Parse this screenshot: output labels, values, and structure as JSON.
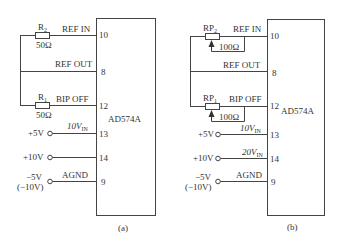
{
  "figure": {
    "panels": [
      {
        "id": "a",
        "caption": "(a)",
        "chip_label": "AD574A",
        "resistors": [
          {
            "name": "R",
            "sub": "2",
            "value": "50Ω"
          },
          {
            "name": "R",
            "sub": "1",
            "value": "50Ω"
          }
        ],
        "pins": [
          {
            "number": "10",
            "signal": "REF IN"
          },
          {
            "number": "8",
            "signal": "REF OUT"
          },
          {
            "number": "12",
            "signal": "BIP OFF"
          },
          {
            "number": "13",
            "signal": "10V",
            "signal_sub": "IN"
          },
          {
            "number": "14",
            "signal": ""
          },
          {
            "number": "9",
            "signal": "AGND"
          }
        ],
        "inputs": [
          {
            "label": "+5V"
          },
          {
            "label": "+10V"
          },
          {
            "label": "−5V",
            "label2": "(−10V)"
          }
        ]
      },
      {
        "id": "b",
        "caption": "(b)",
        "chip_label": "AD574A",
        "resistors": [
          {
            "name": "RP",
            "sub": "2",
            "value": "100Ω"
          },
          {
            "name": "RP",
            "sub": "1",
            "value": "100Ω"
          }
        ],
        "pins": [
          {
            "number": "10",
            "signal": "REF IN"
          },
          {
            "number": "8",
            "signal": "REF OUT"
          },
          {
            "number": "12",
            "signal": "BIP OFF"
          },
          {
            "number": "13",
            "signal": "10V",
            "signal_sub": "IN"
          },
          {
            "number": "14",
            "signal": "20V",
            "signal_sub": "IN"
          },
          {
            "number": "9",
            "signal": "AGND"
          }
        ],
        "inputs": [
          {
            "label": "+5V"
          },
          {
            "label": "+10V"
          },
          {
            "label": "−5V",
            "label2": "(−10V)"
          }
        ]
      }
    ]
  }
}
